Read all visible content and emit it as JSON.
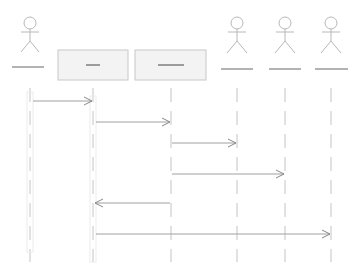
{
  "diagram": {
    "type": "sequence",
    "colors": {
      "stroke": "#b0b0b0",
      "dark_line": "#555555",
      "box_fill": "#f2f2f2",
      "box_stroke": "#c8c8c8",
      "arrow": "#999999"
    },
    "participants": [
      {
        "id": "p1",
        "kind": "actor",
        "label": "",
        "x": 30
      },
      {
        "id": "p2",
        "kind": "object",
        "label": "—",
        "x": 93
      },
      {
        "id": "p3",
        "kind": "object",
        "label": "——",
        "x": 171
      },
      {
        "id": "p4",
        "kind": "actor",
        "label": "",
        "x": 237
      },
      {
        "id": "p5",
        "kind": "actor",
        "label": "",
        "x": 285
      },
      {
        "id": "p6",
        "kind": "actor",
        "label": "",
        "x": 331
      }
    ],
    "messages": [
      {
        "from": "p1",
        "to": "p2",
        "y": 101,
        "label": ""
      },
      {
        "from": "p2",
        "to": "p3",
        "y": 122,
        "label": ""
      },
      {
        "from": "p3",
        "to": "p4",
        "y": 143,
        "label": ""
      },
      {
        "from": "p3",
        "to": "p5",
        "y": 174,
        "label": ""
      },
      {
        "from": "p3",
        "to": "p2",
        "y": 203,
        "label": ""
      },
      {
        "from": "p2",
        "to": "p6",
        "y": 234,
        "label": ""
      }
    ]
  }
}
